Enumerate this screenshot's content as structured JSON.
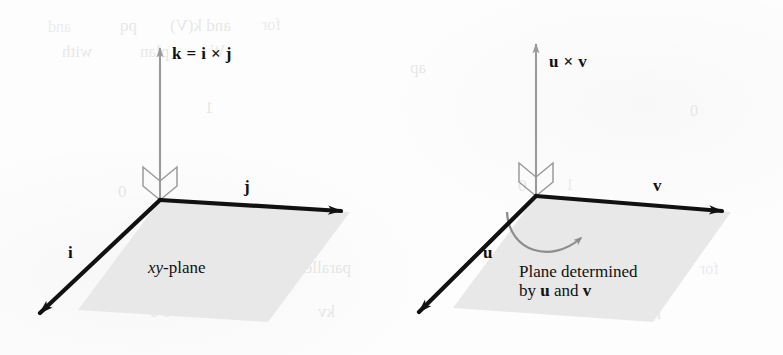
{
  "figure": {
    "width": 783,
    "height": 355,
    "background_color": "#fdfdfd"
  },
  "style": {
    "plane_fill": "#e8e8e8",
    "plane_edge_color": "#111111",
    "axis_color": "#9a9a9a",
    "vector_color": "#111111",
    "arc_color": "#8d8d8d",
    "text_color": "#111111"
  },
  "panels": [
    {
      "id": "left",
      "name": "standard-basis-panel",
      "vertical_vector_label": "k = i × j",
      "plane_label_italic": "xy",
      "plane_label_rest": "-plane",
      "vectors": [
        {
          "name": "i",
          "label": "i",
          "direction": "down-left"
        },
        {
          "name": "j",
          "label": "j",
          "direction": "right"
        },
        {
          "name": "k",
          "label": "k",
          "direction": "up"
        }
      ],
      "right_angle_marker": true,
      "rotation_arc": false
    },
    {
      "id": "right",
      "name": "general-vectors-panel",
      "vertical_vector_label": "u × v",
      "plane_desc_line1": "Plane determined",
      "plane_desc_line2_pre": "by ",
      "plane_desc_line2_u": "u",
      "plane_desc_line2_mid": " and ",
      "plane_desc_line2_v": "v",
      "vectors": [
        {
          "name": "u",
          "label": "u",
          "direction": "down-left"
        },
        {
          "name": "v",
          "label": "v",
          "direction": "right"
        },
        {
          "name": "uxv",
          "label": "u × v",
          "direction": "up"
        }
      ],
      "right_angle_marker": true,
      "rotation_arc": true
    }
  ],
  "ghost_text": [
    {
      "text": "and",
      "x": 48,
      "y": 18
    },
    {
      "text": "pq",
      "x": 120,
      "y": 16
    },
    {
      "text": "and k(V)",
      "x": 170,
      "y": 16
    },
    {
      "text": "for",
      "x": 262,
      "y": 16
    },
    {
      "text": "with",
      "x": 62,
      "y": 42
    },
    {
      "text": "plan",
      "x": 140,
      "y": 42
    },
    {
      "text": "W",
      "x": 210,
      "y": 42
    },
    {
      "text": "ap",
      "x": 410,
      "y": 58
    },
    {
      "text": "1",
      "x": 205,
      "y": 98
    },
    {
      "text": "0",
      "x": 690,
      "y": 102
    },
    {
      "text": "0",
      "x": 118,
      "y": 182
    },
    {
      "text": "0",
      "x": 518,
      "y": 176
    },
    {
      "text": "1",
      "x": 566,
      "y": 176
    },
    {
      "text": "parallel",
      "x": 300,
      "y": 258
    },
    {
      "text": "0 0",
      "x": 150,
      "y": 302
    },
    {
      "text": "0 0",
      "x": 228,
      "y": 302
    },
    {
      "text": "kv",
      "x": 318,
      "y": 302
    },
    {
      "text": "parallel",
      "x": 610,
      "y": 300
    },
    {
      "text": "for",
      "x": 700,
      "y": 260
    }
  ]
}
